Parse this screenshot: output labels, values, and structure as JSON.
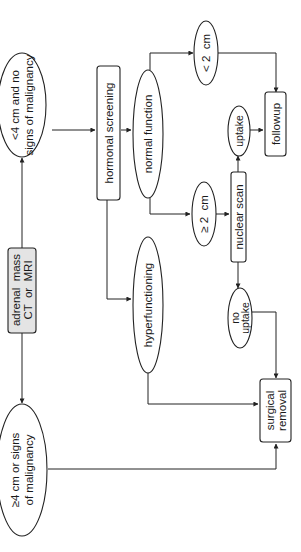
{
  "diagram": {
    "type": "flowchart",
    "orientation": "rotated-90-ccw",
    "title": "",
    "nodes": {
      "adrenal_mass": {
        "line1": "adrenal  mass",
        "line2": "CT  or  MRI",
        "shape": "box",
        "fill": "#e4e4e4"
      },
      "small_no_malignancy": {
        "line1": "<4 cm and no",
        "line2": "signs of malignancy",
        "shape": "ellipse"
      },
      "large_or_malignancy": {
        "line1": "≥4 cm or signs",
        "line2": "of malignancy",
        "shape": "ellipse"
      },
      "hormonal_screening": {
        "label": "hormonal screening",
        "shape": "box"
      },
      "normal_function": {
        "label": "normal function",
        "shape": "ellipse"
      },
      "hyperfunctioning": {
        "label": "hyperfunctioning",
        "shape": "ellipse"
      },
      "lt_2cm": {
        "label": "< 2  cm",
        "shape": "ellipse"
      },
      "ge_2cm": {
        "label": "≥ 2  cm",
        "shape": "ellipse"
      },
      "nuclear_scan": {
        "label": "nuclear scan",
        "shape": "box"
      },
      "uptake": {
        "label": "uptake",
        "shape": "ellipse"
      },
      "no_uptake": {
        "line1": "no",
        "line2": "uptake",
        "shape": "ellipse"
      },
      "followup": {
        "label": "followup",
        "shape": "box"
      },
      "surgical_removal": {
        "line1": "surgical",
        "line2": "removal",
        "shape": "box"
      }
    },
    "edges": [
      {
        "from": "adrenal_mass",
        "to": "small_no_malignancy"
      },
      {
        "from": "adrenal_mass",
        "to": "large_or_malignancy"
      },
      {
        "from": "small_no_malignancy",
        "to": "hormonal_screening"
      },
      {
        "from": "hormonal_screening",
        "to": "normal_function"
      },
      {
        "from": "hormonal_screening",
        "to": "hyperfunctioning"
      },
      {
        "from": "normal_function",
        "to": "lt_2cm"
      },
      {
        "from": "normal_function",
        "to": "ge_2cm"
      },
      {
        "from": "lt_2cm",
        "to": "followup"
      },
      {
        "from": "ge_2cm",
        "to": "nuclear_scan"
      },
      {
        "from": "nuclear_scan",
        "to": "uptake"
      },
      {
        "from": "nuclear_scan",
        "to": "no_uptake"
      },
      {
        "from": "uptake",
        "to": "followup"
      },
      {
        "from": "no_uptake",
        "to": "surgical_removal"
      },
      {
        "from": "hyperfunctioning",
        "to": "surgical_removal"
      },
      {
        "from": "large_or_malignancy",
        "to": "surgical_removal"
      }
    ],
    "colors": {
      "line": "#222222",
      "start_fill": "#e4e4e4",
      "background": "#ffffff"
    }
  }
}
